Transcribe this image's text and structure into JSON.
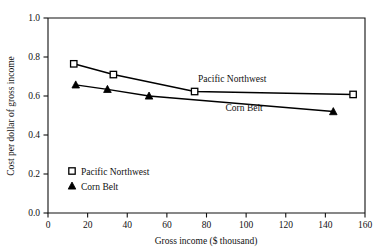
{
  "chart_data": {
    "type": "line",
    "title": "",
    "xlabel": "Gross income ($ thousand)",
    "ylabel": "Cost per dollar of gross income",
    "xlim": [
      0,
      160
    ],
    "ylim": [
      0.0,
      1.0
    ],
    "grid": false,
    "legend_position": "inside-lower-left",
    "xticks": [
      "0",
      "20",
      "40",
      "60",
      "80",
      "100",
      "120",
      "140",
      "160"
    ],
    "xtick_values": [
      0,
      20,
      40,
      60,
      80,
      100,
      120,
      140,
      160
    ],
    "yticks": [
      "0.0",
      "0.2",
      "0.4",
      "0.6",
      "0.8",
      "1.0"
    ],
    "ytick_values": [
      0.0,
      0.2,
      0.4,
      0.6,
      0.8,
      1.0
    ],
    "series": [
      {
        "name": "Pacific Northwest",
        "marker": "open-square",
        "marker_fill": "#ffffff",
        "color": "#000000",
        "points": [
          {
            "x": 13,
            "y": 0.765
          },
          {
            "x": 33,
            "y": 0.71
          },
          {
            "x": 74,
            "y": 0.623
          },
          {
            "x": 154,
            "y": 0.608
          }
        ]
      },
      {
        "name": "Corn Belt",
        "marker": "filled-triangle",
        "marker_fill": "#000000",
        "color": "#000000",
        "points": [
          {
            "x": 14,
            "y": 0.657
          },
          {
            "x": 30,
            "y": 0.634
          },
          {
            "x": 51,
            "y": 0.6
          },
          {
            "x": 144,
            "y": 0.52
          }
        ]
      }
    ],
    "annotations": [
      {
        "text": "Pacific Northwest",
        "x": 93,
        "y": 0.672
      },
      {
        "text": "Corn Belt",
        "x": 99,
        "y": 0.524
      }
    ],
    "legend": [
      {
        "label": "Pacific Northwest",
        "marker": "open-square"
      },
      {
        "label": "Corn Belt",
        "marker": "filled-triangle"
      }
    ],
    "colors": {
      "axis": "#111111",
      "line": "#000000",
      "background": "#ffffff",
      "text": "#111111"
    }
  }
}
